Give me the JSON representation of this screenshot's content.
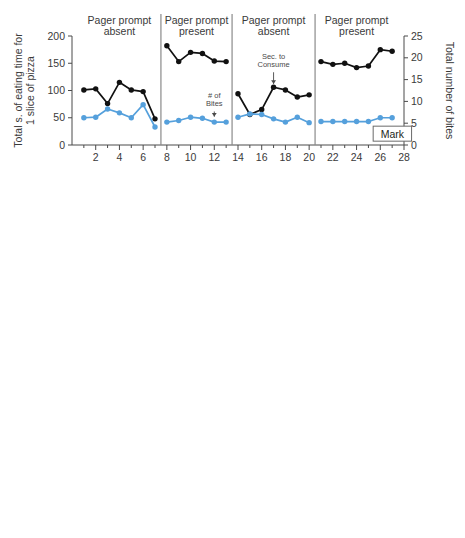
{
  "figure": {
    "xlabel": "Sessions",
    "right_axis_title": "Total number of bites",
    "series_legend": [
      {
        "name": "Sec. to Consume",
        "color": "#111111",
        "axis": "left"
      },
      {
        "name": "# of Bites",
        "color": "#55A0DC",
        "axis": "right"
      }
    ]
  },
  "chart_data": [
    {
      "type": "line",
      "title": "Mark",
      "participant": "Mark",
      "xlabel": "Sessions",
      "ylabel": "Total s. of eating time for 1 slice of pizza",
      "ylabel_right": "Total number of bites",
      "xlim": [
        0,
        28
      ],
      "ylim": [
        0,
        200
      ],
      "ylim_right": [
        0,
        25
      ],
      "yticks": [
        0,
        50,
        100,
        150,
        200
      ],
      "yticks_right": [
        0,
        5,
        10,
        15,
        20,
        25
      ],
      "xticks": [
        2,
        4,
        6,
        8,
        10,
        12,
        14,
        16,
        18,
        20,
        22,
        24,
        26,
        28
      ],
      "grid": false,
      "legend_position": "none",
      "annotations": [
        {
          "text": "# of Bites",
          "x": 12,
          "y": 78,
          "arrow_to_y": 52
        },
        {
          "text": "Sec. to Consume",
          "x": 17,
          "y": 150,
          "arrow_to_y": 112
        }
      ],
      "phases": [
        {
          "label": "Pager prompt absent",
          "x": [
            1,
            2,
            3,
            4,
            5,
            6,
            7
          ],
          "series": [
            {
              "name": "Sec. to Consume",
              "color": "#111111",
              "values": [
                101,
                103,
                76,
                115,
                101,
                98,
                48
              ]
            },
            {
              "name": "# of Bites",
              "color": "#55A0DC",
              "values": [
                50,
                51,
                66,
                59,
                50,
                74,
                33
              ]
            }
          ]
        },
        {
          "label": "Pager prompt present",
          "x": [
            8,
            9,
            10,
            11,
            12,
            13
          ],
          "series": [
            {
              "name": "Sec. to Consume",
              "color": "#111111",
              "values": [
                182,
                153,
                170,
                168,
                154,
                153
              ]
            },
            {
              "name": "# of Bites",
              "color": "#55A0DC",
              "values": [
                42,
                45,
                51,
                49,
                42,
                42
              ]
            }
          ]
        },
        {
          "label": "Pager prompt absent",
          "x": [
            14,
            15,
            16,
            17,
            18,
            19,
            20
          ],
          "series": [
            {
              "name": "Sec. to Consume",
              "color": "#111111",
              "values": [
                94,
                56,
                65,
                106,
                101,
                88,
                92
              ]
            },
            {
              "name": "# of Bites",
              "color": "#55A0DC",
              "values": [
                51,
                57,
                56,
                48,
                42,
                51,
                41
              ]
            }
          ]
        },
        {
          "label": "Pager prompt present",
          "x": [
            21,
            22,
            23,
            24,
            25,
            26,
            27
          ],
          "series": [
            {
              "name": "Sec. to Consume",
              "color": "#111111",
              "values": [
                153,
                148,
                150,
                142,
                145,
                175,
                172
              ]
            },
            {
              "name": "# of Bites",
              "color": "#55A0DC",
              "values": [
                43,
                43,
                43,
                43,
                43,
                50,
                50
              ]
            }
          ]
        }
      ]
    },
    {
      "type": "line",
      "title": "Jack",
      "participant": "Jack",
      "xlabel": "Sessions",
      "ylabel": "Total s. of eating time for 6 oz. of yogurt",
      "ylabel_right": "Total number of bites",
      "xlim": [
        0,
        15
      ],
      "ylim": [
        0,
        250
      ],
      "ylim_right": [
        0,
        25
      ],
      "yticks": [
        0,
        50,
        100,
        150,
        200,
        250
      ],
      "yticks_right": [
        0,
        5,
        10,
        15,
        20,
        25
      ],
      "xticks": [
        1,
        2,
        3,
        4,
        5,
        6,
        7,
        8,
        9,
        10,
        11,
        12,
        13,
        14
      ],
      "grid": false,
      "legend_position": "none",
      "annotations": [
        {
          "text": "Adult absent",
          "x": 13.6,
          "y": 228
        }
      ],
      "phases": [
        {
          "label": "Pager prompt absent",
          "x": [
            1,
            2,
            3,
            4
          ],
          "series": [
            {
              "name": "Sec. to Consume",
              "color": "#111111",
              "values": [
                63,
                61,
                44,
                63
              ]
            },
            {
              "name": "# of Bites",
              "color": "#55A0DC",
              "values": [
                171,
                161,
                143,
                152
              ]
            }
          ]
        },
        {
          "label": "Pager prompt present",
          "x": [
            5,
            6,
            7,
            8
          ],
          "series": [
            {
              "name": "Sec. to Consume",
              "color": "#111111",
              "values": [
                212,
                218,
                212,
                217
              ]
            },
            {
              "name": "# of Bites",
              "color": "#55A0DC",
              "values": [
                161,
                151,
                131,
                131
              ]
            }
          ]
        },
        {
          "label": "Pager prompt absent",
          "x": [
            9,
            10,
            11
          ],
          "series": [
            {
              "name": "Sec. to Consume",
              "color": "#111111",
              "values": [
                61,
                72,
                62
              ]
            },
            {
              "name": "# of Bites",
              "color": "#55A0DC",
              "values": [
                162,
                170,
                161
              ]
            }
          ]
        },
        {
          "label": "Pager prompt present",
          "x": [
            12,
            13
          ],
          "series": [
            {
              "name": "Sec. to Consume",
              "color": "#111111",
              "values": [
                189,
                179
              ]
            },
            {
              "name": "# of Bites",
              "color": "#55A0DC",
              "values": [
                141,
                131
              ]
            }
          ]
        },
        {
          "label": "",
          "x": [
            14
          ],
          "series": [
            {
              "name": "Sec. to Consume",
              "color": "#111111",
              "values": [
                180
              ]
            },
            {
              "name": "# of Bites",
              "color": "#55A0DC",
              "values": []
            }
          ]
        }
      ]
    },
    {
      "type": "line",
      "title": "John",
      "participant": "John",
      "xlabel": "Sessions",
      "ylabel": "Total s. of eating time for 10 pieces of clementine",
      "ylabel_right": "Total number of bites",
      "xlim": [
        0,
        15
      ],
      "ylim": [
        0,
        100
      ],
      "ylim_right": [
        0,
        25
      ],
      "yticks": [
        0,
        25,
        50,
        75,
        100
      ],
      "yticks_right": [
        0,
        5,
        10,
        15,
        20,
        25
      ],
      "xticks": [
        1,
        2,
        3,
        4,
        5,
        6,
        7,
        8,
        9,
        10,
        11,
        12,
        13,
        14
      ],
      "grid": false,
      "legend_position": "none",
      "annotations": [],
      "phases": [
        {
          "label": "Pager prompt absent",
          "x": [
            1,
            2,
            3,
            4
          ],
          "series": [
            {
              "name": "Sec. to Consume",
              "color": "#111111",
              "values": [
                24,
                26,
                30,
                24
              ]
            },
            {
              "name": "# of Bites",
              "color": "#55A0DC",
              "values": [
                41,
                41,
                41,
                41
              ]
            }
          ]
        },
        {
          "label": "Pager prompt present",
          "x": [
            5,
            6,
            7,
            8
          ],
          "series": [
            {
              "name": "Sec. to Consume",
              "color": "#111111",
              "values": [
                85,
                90,
                84,
                90
              ]
            },
            {
              "name": "# of Bites",
              "color": "#55A0DC",
              "values": [
                41,
                41,
                41,
                41
              ]
            }
          ]
        },
        {
          "label": "Pager prompt absent",
          "x": [
            9,
            10,
            11,
            12
          ],
          "series": [
            {
              "name": "Sec. to Consume",
              "color": "#111111",
              "values": [
                31,
                41,
                29,
                34
              ]
            },
            {
              "name": "# of Bites",
              "color": "#55A0DC",
              "values": [
                41,
                41,
                41,
                41
              ]
            }
          ]
        },
        {
          "label": "Pager prompt present",
          "x": [
            13,
            14
          ],
          "series": [
            {
              "name": "Sec. to Consume",
              "color": "#111111",
              "values": [
                83,
                79
              ]
            },
            {
              "name": "# of Bites",
              "color": "#55A0DC",
              "values": [
                41,
                41
              ]
            }
          ]
        }
      ]
    }
  ]
}
